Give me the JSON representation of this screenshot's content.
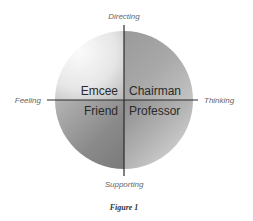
{
  "diagram": {
    "axes": {
      "top": "Directing",
      "bottom": "Supporting",
      "left": "Feeling",
      "right": "Thinking"
    },
    "quadrants": {
      "top_left": "Emcee",
      "top_right": "Chairman",
      "bottom_left": "Friend",
      "bottom_right": "Professor"
    },
    "caption": "Figure 1",
    "colors": {
      "top_left_light": "#f4f4f4",
      "top_left_dark": "#c8c8c8",
      "top_right_light": "#c8c8c8",
      "top_right_dark": "#888888",
      "bottom_left_light": "#c0c0c0",
      "bottom_left_dark": "#7e7e7e",
      "bottom_right_light": "#dcdcdc",
      "bottom_right_dark": "#9a9a9a",
      "axis_line": "#2a2a2a"
    }
  }
}
